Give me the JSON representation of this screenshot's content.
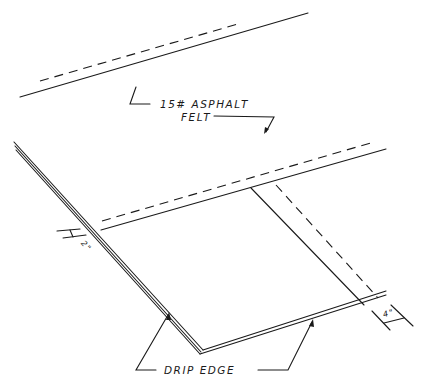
{
  "diagram": {
    "type": "roofing-detail",
    "labels": {
      "felt_line1": "15# ASPHALT",
      "felt_line2": "FELT",
      "drip_edge": "DRIP EDGE",
      "dim_left": "2\"",
      "dim_right": "4\""
    },
    "colors": {
      "line": "#1a1a1a",
      "background": "#ffffff"
    }
  }
}
